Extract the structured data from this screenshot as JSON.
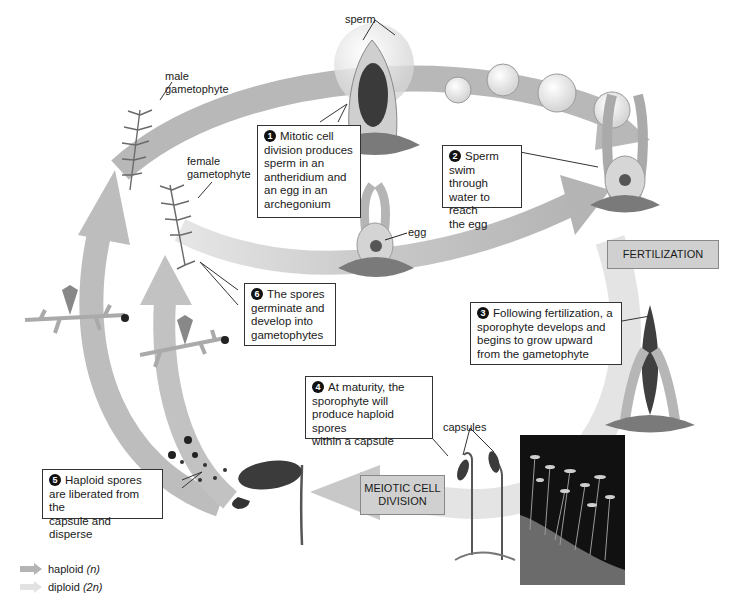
{
  "diagram": {
    "title_cut_off": "",
    "colors": {
      "haploid_arrow": "#b4b4b4",
      "diploid_arrow": "#e2e2e2",
      "stage_box": "#d0d0d0",
      "callout_border": "#333333",
      "photo_bg": "#111111"
    },
    "labels": {
      "sperm": "sperm",
      "male_gametophyte_1": "male",
      "male_gametophyte_2": "gametophyte",
      "female_gametophyte_1": "female",
      "female_gametophyte_2": "gametophyte",
      "egg": "egg",
      "capsules": "capsules"
    },
    "stages": {
      "fertilization": "FERTILIZATION",
      "meiotic_1": "MEIOTIC CELL",
      "meiotic_2": "DIVISION"
    },
    "steps": [
      {
        "num": "1",
        "lines": [
          "Mitotic cell",
          "division produces",
          "sperm in an",
          "antheridium and",
          "an egg in an",
          "archegonium"
        ]
      },
      {
        "num": "2",
        "lines": [
          "Sperm",
          "swim through",
          "water to reach",
          "the egg"
        ]
      },
      {
        "num": "3",
        "lines": [
          "Following fertilization, a",
          "sporophyte develops and",
          "begins to grow upward",
          "from the gametophyte"
        ]
      },
      {
        "num": "4",
        "lines": [
          "At maturity, the",
          "sporophyte will",
          "produce haploid spores",
          "within a capsule"
        ]
      },
      {
        "num": "5",
        "lines": [
          "Haploid spores",
          "are liberated from the",
          "capsule and disperse"
        ]
      },
      {
        "num": "6",
        "lines": [
          "The spores",
          "germinate and",
          "develop into",
          "gametophytes"
        ]
      }
    ],
    "legend": [
      {
        "label": "haploid",
        "symbol": "(n)",
        "icon": "haploid-arrow-icon"
      },
      {
        "label": "diploid",
        "symbol": "(2n)",
        "icon": "diploid-arrow-icon"
      }
    ],
    "photo_alt": "moss sporophytes photo"
  }
}
